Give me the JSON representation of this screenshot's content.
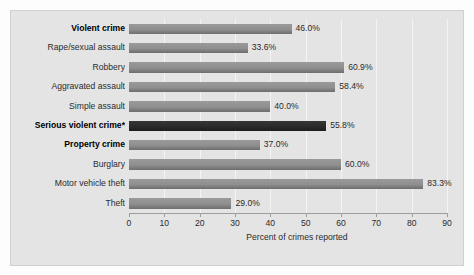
{
  "chart_data": {
    "type": "bar",
    "orientation": "horizontal",
    "title": "",
    "xlabel": "Percent of crimes reported",
    "ylabel": "",
    "xlim": [
      0,
      90
    ],
    "xticks": [
      0,
      10,
      20,
      30,
      40,
      50,
      60,
      70,
      80,
      90
    ],
    "xtick_labels": [
      "0",
      "10",
      "20",
      "30",
      "40",
      "50",
      "60",
      "70",
      "80",
      "90"
    ],
    "grid": true,
    "legend": "none",
    "categories": [
      "Violent crime",
      "Rape/sexual assault",
      "Robbery",
      "Aggravated assault",
      "Simple assault",
      "Serious violent crime*",
      "Property crime",
      "Burglary",
      "Motor vehicle theft",
      "Theft"
    ],
    "values": [
      46.0,
      33.6,
      60.9,
      58.4,
      40.0,
      55.8,
      37.0,
      60.0,
      83.3,
      29.0
    ],
    "value_labels": [
      "46.0%",
      "33.6%",
      "60.9%",
      "58.4%",
      "40.0%",
      "55.8%",
      "37.0%",
      "60.0%",
      "83.3%",
      "29.0%"
    ],
    "bold_categories": [
      "Violent crime",
      "Serious violent crime*",
      "Property crime"
    ],
    "highlight_categories": [
      "Serious violent crime*"
    ],
    "colors": {
      "bar": "#8f8f8f",
      "bar_highlight": "#2b2b2b",
      "panel_background": "#e4e4e4",
      "gridline": "#f4f4f4",
      "axis": "#9d9d9d",
      "text": "#2b2b2b"
    }
  }
}
